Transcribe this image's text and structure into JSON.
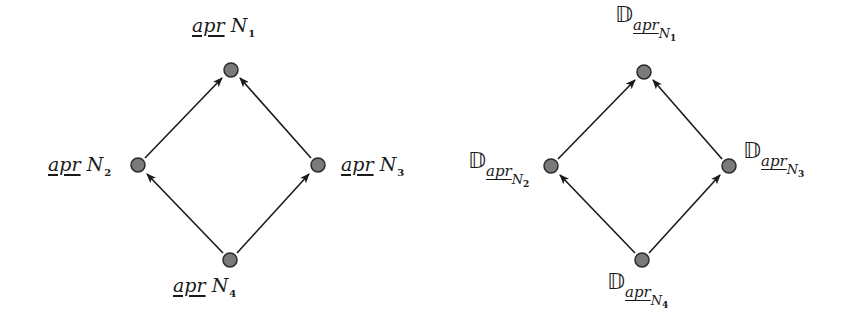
{
  "diagrams": [
    {
      "id": "lower-approximation-lattice",
      "nodes": [
        {
          "id": "N1",
          "prefix": "apr",
          "var": "N",
          "sub": "1",
          "x": 231,
          "y": 70
        },
        {
          "id": "N2",
          "prefix": "apr",
          "var": "N",
          "sub": "2",
          "x": 138,
          "y": 165
        },
        {
          "id": "N3",
          "prefix": "apr",
          "var": "N",
          "sub": "3",
          "x": 318,
          "y": 165
        },
        {
          "id": "N4",
          "prefix": "apr",
          "var": "N",
          "sub": "4",
          "x": 230,
          "y": 260
        }
      ],
      "edges": [
        {
          "from": "N2",
          "to": "N1"
        },
        {
          "from": "N3",
          "to": "N1"
        },
        {
          "from": "N4",
          "to": "N2"
        },
        {
          "from": "N4",
          "to": "N3"
        }
      ]
    },
    {
      "id": "d-operator-lattice",
      "symbol": "𝔻",
      "nodes": [
        {
          "id": "N1",
          "prefix": "apr",
          "var": "N",
          "sub": "1",
          "x": 644,
          "y": 72
        },
        {
          "id": "N2",
          "prefix": "apr",
          "var": "N",
          "sub": "2",
          "x": 551,
          "y": 166
        },
        {
          "id": "N3",
          "prefix": "apr",
          "var": "N",
          "sub": "3",
          "x": 729,
          "y": 166
        },
        {
          "id": "N4",
          "prefix": "apr",
          "var": "N",
          "sub": "4",
          "x": 642,
          "y": 260
        }
      ],
      "edges": [
        {
          "from": "N2",
          "to": "N1"
        },
        {
          "from": "N3",
          "to": "N1"
        },
        {
          "from": "N4",
          "to": "N2"
        },
        {
          "from": "N4",
          "to": "N3"
        }
      ]
    }
  ],
  "labels": {
    "left": {
      "n1": {
        "prefix": "apr",
        "var": "N",
        "sub": "1"
      },
      "n2": {
        "prefix": "apr",
        "var": "N",
        "sub": "2"
      },
      "n3": {
        "prefix": "apr",
        "var": "N",
        "sub": "3"
      },
      "n4": {
        "prefix": "apr",
        "var": "N",
        "sub": "4"
      }
    },
    "right": {
      "symbol": "𝔻",
      "n1": {
        "prefix": "apr",
        "var": "N",
        "sub": "1"
      },
      "n2": {
        "prefix": "apr",
        "var": "N",
        "sub": "2"
      },
      "n3": {
        "prefix": "apr",
        "var": "N",
        "sub": "3"
      },
      "n4": {
        "prefix": "apr",
        "var": "N",
        "sub": "4"
      }
    }
  },
  "colors": {
    "node_fill": "#7a7a7a",
    "node_stroke": "#2a2a2a",
    "edge": "#1a1a1a"
  }
}
